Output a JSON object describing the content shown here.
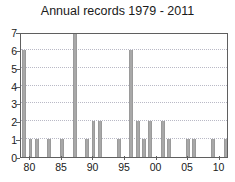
{
  "chart_data": {
    "type": "bar",
    "title": "Annual records 1979 - 2011",
    "xlabel": "",
    "ylabel": "",
    "xlim": [
      1978.5,
      2011.5
    ],
    "ylim": [
      0,
      7
    ],
    "yticks": [
      0,
      1,
      2,
      3,
      4,
      5,
      6,
      7
    ],
    "xticks": [
      1980,
      1985,
      1990,
      1995,
      2000,
      2005,
      2010
    ],
    "xtick_labels": [
      "80",
      "85",
      "90",
      "95",
      "00",
      "05",
      "10"
    ],
    "grid": "horizontal-dotted",
    "legend": "none",
    "bar_color": "#a8a8a8",
    "categories": [
      1979,
      1980,
      1981,
      1982,
      1983,
      1984,
      1985,
      1986,
      1987,
      1988,
      1989,
      1990,
      1991,
      1992,
      1993,
      1994,
      1995,
      1996,
      1997,
      1998,
      1999,
      2000,
      2001,
      2002,
      2003,
      2004,
      2005,
      2006,
      2007,
      2008,
      2009,
      2010,
      2011
    ],
    "values": [
      6,
      1,
      1,
      0,
      1,
      0,
      1,
      0,
      7,
      0,
      1,
      2,
      2,
      0,
      0,
      1,
      0,
      6,
      2,
      1,
      2,
      0,
      2,
      1,
      0,
      0,
      1,
      1,
      0,
      0,
      1,
      0,
      1
    ]
  }
}
